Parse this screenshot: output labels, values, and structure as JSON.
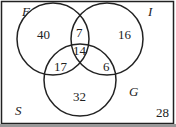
{
  "diagram": {
    "type": "venn",
    "universe_label": "S",
    "sets": [
      {
        "name": "F"
      },
      {
        "name": "I"
      },
      {
        "name": "G"
      }
    ],
    "regions": {
      "F_only": "40",
      "I_only": "16",
      "G_only": "32",
      "F_and_I_only": "7",
      "F_and_G_only": "17",
      "I_and_G_only": "6",
      "F_I_G": "14",
      "outside": "28"
    },
    "colors": {
      "stroke": "#222222",
      "background": "#ffffff"
    }
  }
}
